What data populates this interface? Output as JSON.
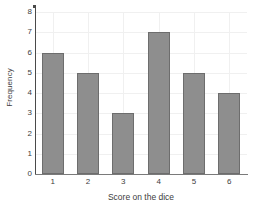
{
  "chart_data": {
    "type": "bar",
    "title": "",
    "xlabel": "Score on the dice",
    "ylabel": "Frequency",
    "categories": [
      "1",
      "2",
      "3",
      "4",
      "5",
      "6"
    ],
    "values": [
      6,
      5,
      3,
      7,
      5,
      4
    ],
    "ylim": [
      0,
      8
    ],
    "yticks": [
      0,
      1,
      2,
      3,
      4,
      5,
      6,
      7,
      8
    ],
    "ytick_labels": [
      "0",
      "1",
      "2",
      "3",
      "4",
      "5",
      "6",
      "7",
      "8"
    ],
    "xtick_labels": [
      "1",
      "2",
      "3",
      "4",
      "5",
      "6"
    ],
    "grid": true,
    "legend": false,
    "bar_color": "#8e8e8e",
    "bar_edge_color": "#6d6d6d",
    "grid_color": "#f0f0f0",
    "axis_color": "#4a4a4a",
    "background": "#ffffff"
  }
}
